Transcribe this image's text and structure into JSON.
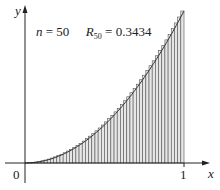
{
  "chart_data": {
    "type": "bar",
    "title": "",
    "annotation": {
      "n_label": "n",
      "n_value": "= 50",
      "r_label": "R",
      "r_sub": "50",
      "r_value": "= 0.3434"
    },
    "function": "y = x^2",
    "method": "right-endpoint Riemann sum",
    "n": 50,
    "sum": 0.3434,
    "xlabel": "x",
    "ylabel": "y",
    "xlim": [
      0,
      1
    ],
    "ylim": [
      0,
      1
    ],
    "x_ticks": [
      "0",
      "1"
    ],
    "grid": false,
    "legend": null,
    "bar_color": "#e6e6e6",
    "edge_color": "#555555",
    "categories_note": "rectangles over subintervals [(i-1)/50, i/50], height = (i/50)^2, i=1..50"
  }
}
